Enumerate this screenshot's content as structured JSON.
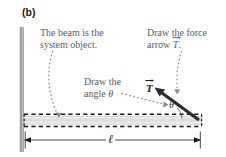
{
  "figure": {
    "panel_label": "(b)",
    "background_color": "#ffffff"
  },
  "callouts": [
    {
      "id": "beam-system",
      "text": "The beam is the\nsystem object.",
      "color": "#5c5c5c"
    },
    {
      "id": "force-arrow",
      "text_line1": "Draw the force",
      "text_line2_prefix": "arrow ",
      "text_line2_symbol": "T",
      "text_line2_suffix": ".",
      "color": "#5c5c5c"
    },
    {
      "id": "angle",
      "text_line1": "Draw the",
      "text_line2_prefix": "angle ",
      "text_line2_symbol": "θ",
      "color": "#5c5c5c"
    }
  ],
  "diagram": {
    "wall_color": "#9a9a9a",
    "beam_fill_color": "#e2e2e2",
    "beam_dash_color": "#1a1a1a",
    "arrow_color": "#2b2b2b",
    "leader_color": "#7d7d7d",
    "dimension_color": "#1a1a1a",
    "force_vector_label": "T",
    "angle_label": "θ",
    "length_label": "ℓ"
  }
}
